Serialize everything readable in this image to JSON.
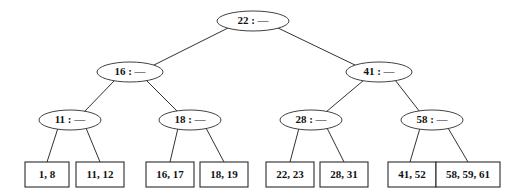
{
  "figure": {
    "type": "b-tree-diagram",
    "title": "",
    "width": 507,
    "height": 196,
    "background_color": "#ffffff",
    "stroke_color": "#2b2b2b",
    "text_color": "#111111",
    "separator": " : ",
    "empty_pointer_glyph": "—"
  },
  "tree": {
    "levels": [
      {
        "level": 0,
        "name": "root-level",
        "nodes": [
          {
            "id": "n-22",
            "label": "22 : —",
            "key": "22",
            "cx": 253,
            "cy": 21,
            "rx": 36,
            "ry": 10
          }
        ]
      },
      {
        "level": 1,
        "name": "internal-level-1",
        "nodes": [
          {
            "id": "n-16",
            "label": "16 : —",
            "key": "16",
            "cx": 130,
            "cy": 72,
            "rx": 33,
            "ry": 10
          },
          {
            "id": "n-41",
            "label": "41 : —",
            "key": "41",
            "cx": 379,
            "cy": 72,
            "rx": 33,
            "ry": 10
          }
        ]
      },
      {
        "level": 2,
        "name": "internal-level-2",
        "nodes": [
          {
            "id": "n-11",
            "label": "11 : —",
            "key": "11",
            "cx": 70,
            "cy": 120,
            "rx": 31,
            "ry": 10
          },
          {
            "id": "n-18",
            "label": "18 : —",
            "key": "18",
            "cx": 190,
            "cy": 120,
            "rx": 31,
            "ry": 10
          },
          {
            "id": "n-28",
            "label": "28 : —",
            "key": "28",
            "cx": 311,
            "cy": 120,
            "rx": 31,
            "ry": 10
          },
          {
            "id": "n-58",
            "label": "58 : —",
            "key": "58",
            "cx": 432,
            "cy": 120,
            "rx": 31,
            "ry": 10
          }
        ]
      }
    ],
    "leaves": [
      {
        "id": "l-1",
        "label": "1, 8",
        "values": [
          1,
          8
        ],
        "x": 25,
        "y": 162,
        "w": 44,
        "h": 25
      },
      {
        "id": "l-2",
        "label": "11, 12",
        "values": [
          11,
          12
        ],
        "x": 76,
        "y": 162,
        "w": 48,
        "h": 25
      },
      {
        "id": "l-3",
        "label": "16, 17",
        "values": [
          16,
          17
        ],
        "x": 146,
        "y": 162,
        "w": 48,
        "h": 25
      },
      {
        "id": "l-4",
        "label": "18, 19",
        "values": [
          18,
          19
        ],
        "x": 200,
        "y": 162,
        "w": 48,
        "h": 25
      },
      {
        "id": "l-5",
        "label": "22, 23",
        "values": [
          22,
          23
        ],
        "x": 266,
        "y": 162,
        "w": 48,
        "h": 25
      },
      {
        "id": "l-6",
        "label": "28, 31",
        "values": [
          28,
          31
        ],
        "x": 320,
        "y": 162,
        "w": 48,
        "h": 25
      },
      {
        "id": "l-7",
        "label": "41, 52",
        "values": [
          41,
          52
        ],
        "x": 388,
        "y": 162,
        "w": 48,
        "h": 25
      },
      {
        "id": "l-8",
        "label": "58, 59, 61",
        "values": [
          58,
          59,
          61
        ],
        "x": 436,
        "y": 162,
        "w": 64,
        "h": 25
      }
    ],
    "edges": [
      {
        "id": "e-22-16",
        "from": "n-22",
        "to": "n-16",
        "x1": 228,
        "y1": 28,
        "x2": 152,
        "y2": 66
      },
      {
        "id": "e-22-41",
        "from": "n-22",
        "to": "n-41",
        "x1": 278,
        "y1": 28,
        "x2": 357,
        "y2": 66
      },
      {
        "id": "e-16-11",
        "from": "n-16",
        "to": "n-11",
        "x1": 115,
        "y1": 80,
        "x2": 84,
        "y2": 112
      },
      {
        "id": "e-16-18",
        "from": "n-16",
        "to": "n-18",
        "x1": 146,
        "y1": 80,
        "x2": 178,
        "y2": 112
      },
      {
        "id": "e-41-28",
        "from": "n-41",
        "to": "n-28",
        "x1": 364,
        "y1": 80,
        "x2": 326,
        "y2": 112
      },
      {
        "id": "e-41-58",
        "from": "n-41",
        "to": "n-58",
        "x1": 395,
        "y1": 80,
        "x2": 420,
        "y2": 112
      },
      {
        "id": "e-11-l1",
        "from": "n-11",
        "to": "l-1",
        "x1": 58,
        "y1": 128,
        "x2": 47,
        "y2": 162
      },
      {
        "id": "e-11-l2",
        "from": "n-11",
        "to": "l-2",
        "x1": 86,
        "y1": 128,
        "x2": 100,
        "y2": 162
      },
      {
        "id": "e-18-l3",
        "from": "n-18",
        "to": "l-3",
        "x1": 178,
        "y1": 128,
        "x2": 170,
        "y2": 162
      },
      {
        "id": "e-18-l4",
        "from": "n-18",
        "to": "l-4",
        "x1": 206,
        "y1": 128,
        "x2": 224,
        "y2": 162
      },
      {
        "id": "e-28-l5",
        "from": "n-28",
        "to": "l-5",
        "x1": 299,
        "y1": 128,
        "x2": 290,
        "y2": 162
      },
      {
        "id": "e-28-l6",
        "from": "n-28",
        "to": "l-6",
        "x1": 327,
        "y1": 128,
        "x2": 344,
        "y2": 162
      },
      {
        "id": "e-58-l7",
        "from": "n-58",
        "to": "l-7",
        "x1": 420,
        "y1": 128,
        "x2": 410,
        "y2": 162
      },
      {
        "id": "e-58-l8",
        "from": "n-58",
        "to": "l-8",
        "x1": 448,
        "y1": 128,
        "x2": 468,
        "y2": 162
      }
    ]
  }
}
